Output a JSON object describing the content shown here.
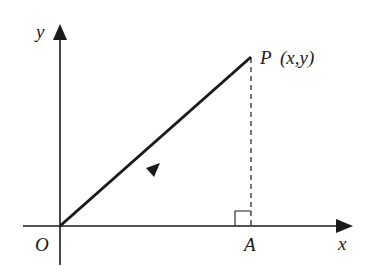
{
  "diagram": {
    "axes": {
      "x_label": "x",
      "y_label": "y",
      "origin_label": "O"
    },
    "points": {
      "P": {
        "label": "P",
        "coords_label": "(x,y)"
      },
      "A": {
        "label": "A"
      }
    },
    "elements": [
      "x-axis with arrow",
      "y-axis with arrow",
      "vector OP with midpoint arrowhead",
      "dashed perpendicular PA",
      "right-angle marker at A"
    ],
    "colors": {
      "stroke": "#1a1a1a",
      "background": "#ffffff"
    }
  }
}
